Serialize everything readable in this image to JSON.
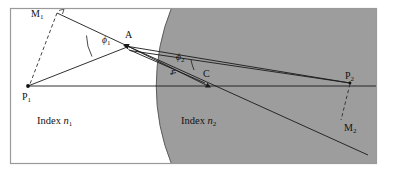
{
  "figure": {
    "frame": {
      "border_color": "#9a9a9a",
      "background_color": "#ffffff"
    },
    "media": {
      "left_region_fill": "#ffffff",
      "right_region_fill": "#9d9d9d",
      "arc_stroke": "#555555"
    },
    "line_color": "#1a1a1a",
    "dashed_color": "#3a3a3a"
  },
  "labels": {
    "m1": {
      "text": "M",
      "sub": "1",
      "x": 31,
      "y": 9
    },
    "p1": {
      "text": "P",
      "sub": "1",
      "x": 22,
      "y": 92
    },
    "a": {
      "text": "A",
      "sub": "",
      "x": 125,
      "y": 30
    },
    "c": {
      "text": "C",
      "sub": "",
      "x": 203,
      "y": 69
    },
    "p2": {
      "text": "P",
      "sub": "2",
      "x": 345,
      "y": 71
    },
    "m2": {
      "text": "M",
      "sub": "2",
      "x": 344,
      "y": 123
    },
    "phi1": {
      "text": "ϕ",
      "sub": "1",
      "x": 102,
      "y": 36
    },
    "phi2": {
      "text": "ϕ",
      "sub": "2",
      "x": 176,
      "y": 53
    },
    "r": {
      "text": "r",
      "sub": "",
      "x": 171,
      "y": 68
    },
    "index1": {
      "prefix": "Index",
      "symbol": "n",
      "sub": "1",
      "x": 37,
      "y": 116
    },
    "index2": {
      "prefix": "Index",
      "symbol": "n",
      "sub": "2",
      "x": 181,
      "y": 116
    }
  },
  "points": {
    "P1": {
      "x": 28,
      "y": 86
    },
    "A": {
      "x": 128.5,
      "y": 46.5
    },
    "M1": {
      "x": 57,
      "y": 13
    },
    "C": {
      "x": 207,
      "y": 79
    },
    "P2": {
      "x": 350,
      "y": 83
    },
    "M2": {
      "x": 341,
      "y": 124
    },
    "axis_left": {
      "x": 28,
      "y": 86
    },
    "axis_right": {
      "x": 377,
      "y": 86
    }
  },
  "geometry": {
    "sphere_center_x": 320,
    "sphere_center_y": 86,
    "sphere_radius": 207,
    "frame": {
      "x": 10,
      "y": 8,
      "w": 367,
      "h": 156
    }
  }
}
